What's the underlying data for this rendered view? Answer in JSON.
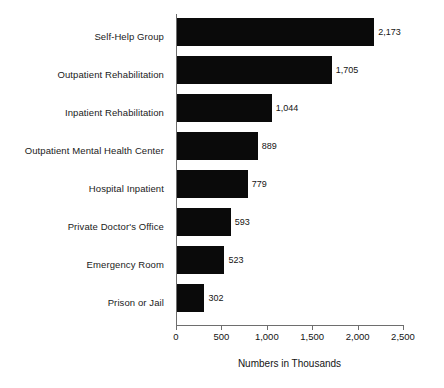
{
  "chart_data": {
    "type": "bar",
    "orientation": "horizontal",
    "title": "",
    "xlabel": "Numbers in Thousands",
    "ylabel": "",
    "xlim": [
      0,
      2500
    ],
    "xticks": [
      0,
      500,
      1000,
      1500,
      2000,
      2500
    ],
    "xticklabels": [
      "0",
      "500",
      "1,000",
      "1,500",
      "2,000",
      "2,500"
    ],
    "grid": false,
    "legend": false,
    "bar_color": "#0a0a0a",
    "axis_color": "#6e6e6e",
    "categories": [
      "Self-Help Group",
      "Outpatient Rehabilitation",
      "Inpatient Rehabilitation",
      "Outpatient Mental Health Center",
      "Hospital Inpatient",
      "Private Doctor's Office",
      "Emergency Room",
      "Prison or Jail"
    ],
    "values": [
      2173,
      1705,
      1044,
      889,
      779,
      593,
      523,
      302
    ],
    "value_labels": [
      "2,173",
      "1,705",
      "1,044",
      "889",
      "779",
      "593",
      "523",
      "302"
    ]
  }
}
